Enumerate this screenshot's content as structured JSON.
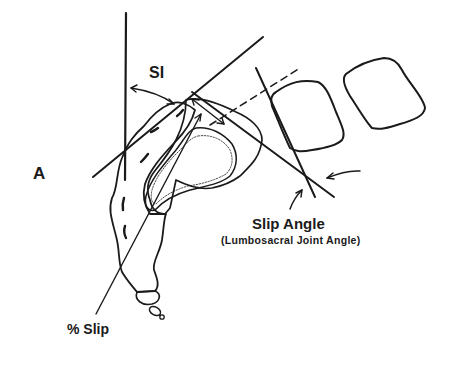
{
  "figure": {
    "panel_label": "A",
    "labels": {
      "sacral_inclination": "SI",
      "slip_angle": "Slip Angle",
      "slip_angle_subtitle": "(Lumbosacral Joint Angle)",
      "percent_slip": "% Slip"
    },
    "colors": {
      "ink": "#1a1a1a",
      "background": "#ffffff"
    }
  }
}
